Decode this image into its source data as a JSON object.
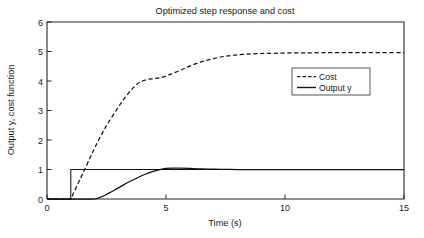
{
  "chart_data": {
    "type": "line",
    "title": "Optimized step response and cost",
    "xlabel": "Time (s)",
    "ylabel": "Output y, cost function",
    "xlim": [
      0,
      15
    ],
    "ylim": [
      0,
      6
    ],
    "xticks": [
      0,
      5,
      10,
      15
    ],
    "yticks": [
      0,
      1,
      2,
      3,
      4,
      5,
      6
    ],
    "xtick_labels": [
      "0",
      "5",
      "10",
      "15"
    ],
    "ytick_labels": [
      "0",
      "1",
      "2",
      "3",
      "4",
      "5",
      "6"
    ],
    "grid": false,
    "legend_position": "center-right",
    "legend_entries": [
      {
        "label": "Cost",
        "style": "dashed"
      },
      {
        "label": "Output y",
        "style": "solid"
      }
    ],
    "series": [
      {
        "name": "Cost",
        "style": "dashed",
        "color": "#111111",
        "x": [
          0,
          0.5,
          1.0,
          1.1,
          1.3,
          1.5,
          1.8,
          2.0,
          2.3,
          2.6,
          3.0,
          3.3,
          3.6,
          3.9,
          4.2,
          4.5,
          4.8,
          5.1,
          5.5,
          5.9,
          6.3,
          6.7,
          7.1,
          7.5,
          7.9,
          8.4,
          8.9,
          9.5,
          10.1,
          10.8,
          11.5,
          12.3,
          13.1,
          14.0,
          15.0
        ],
        "y": [
          0,
          0,
          0,
          0.18,
          0.52,
          0.86,
          1.38,
          1.72,
          2.2,
          2.62,
          3.12,
          3.46,
          3.75,
          3.96,
          4.05,
          4.08,
          4.12,
          4.2,
          4.33,
          4.47,
          4.6,
          4.7,
          4.78,
          4.84,
          4.88,
          4.91,
          4.93,
          4.94,
          4.95,
          4.95,
          4.96,
          4.96,
          4.96,
          4.96,
          4.96
        ]
      },
      {
        "name": "Output y",
        "style": "solid",
        "color": "#111111",
        "x": [
          0,
          0.5,
          1.0,
          1.5,
          2.0,
          2.3,
          2.6,
          2.9,
          3.2,
          3.5,
          3.8,
          4.1,
          4.4,
          4.7,
          5.0,
          5.3,
          5.6,
          6.0,
          6.5,
          7.0,
          7.5,
          8.0,
          9.0,
          10.0,
          11.0,
          12.0,
          13.0,
          14.0,
          15.0
        ],
        "y": [
          0,
          0,
          0,
          0,
          0,
          0.08,
          0.2,
          0.33,
          0.47,
          0.6,
          0.72,
          0.83,
          0.92,
          0.99,
          1.04,
          1.05,
          1.045,
          1.035,
          1.02,
          1.01,
          1.005,
          1.0,
          1.0,
          1.0,
          1.0,
          1.0,
          1.0,
          1.0,
          1.0
        ]
      },
      {
        "name": "Step reference",
        "style": "solid",
        "color": "#111111",
        "x": [
          0,
          1.0,
          1.0,
          15.0
        ],
        "y": [
          0,
          0,
          1.0,
          1.0
        ]
      }
    ]
  }
}
